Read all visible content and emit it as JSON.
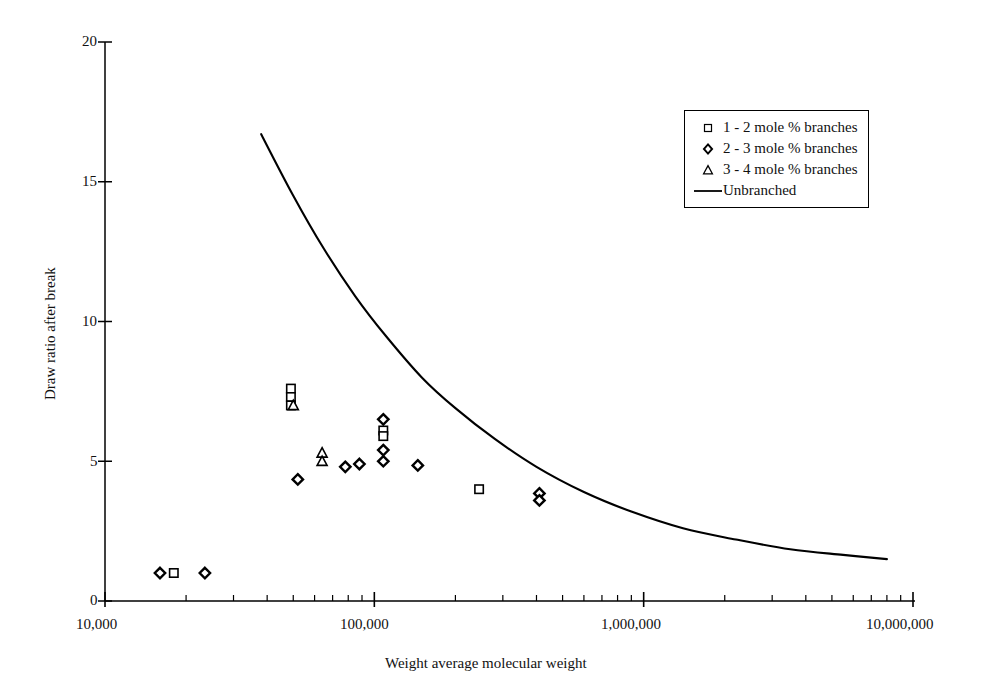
{
  "chart_data": {
    "type": "scatter",
    "title": "",
    "xlabel": "Weight average molecular weight",
    "ylabel": "Draw ratio after break",
    "xscale": "log",
    "yscale": "linear",
    "xlim": [
      10000,
      10000000
    ],
    "ylim": [
      0,
      20
    ],
    "xticks": [
      "10,000",
      "100,000",
      "1,000,000",
      "10,000,000"
    ],
    "xtick_values": [
      10000,
      100000,
      1000000,
      10000000
    ],
    "yticks": [
      "0",
      "5",
      "10",
      "15",
      "20"
    ],
    "ytick_values": [
      0,
      5,
      10,
      15,
      20
    ],
    "grid": false,
    "legend_position": "top-right",
    "series": [
      {
        "name": "1 - 2 mole % branches",
        "marker": "open-square",
        "points": [
          {
            "x": 18000,
            "y": 1.0
          },
          {
            "x": 49000,
            "y": 7.6
          },
          {
            "x": 49000,
            "y": 7.3
          },
          {
            "x": 49000,
            "y": 7.0
          },
          {
            "x": 108000,
            "y": 6.1
          },
          {
            "x": 108000,
            "y": 5.9
          },
          {
            "x": 245000,
            "y": 4.0
          }
        ]
      },
      {
        "name": "2 - 3 mole % branches",
        "marker": "open-diamond",
        "points": [
          {
            "x": 16000,
            "y": 1.0
          },
          {
            "x": 23500,
            "y": 1.0
          },
          {
            "x": 52000,
            "y": 4.35
          },
          {
            "x": 78000,
            "y": 4.8
          },
          {
            "x": 88000,
            "y": 4.9
          },
          {
            "x": 108000,
            "y": 6.5
          },
          {
            "x": 108000,
            "y": 5.4
          },
          {
            "x": 108000,
            "y": 5.0
          },
          {
            "x": 145000,
            "y": 4.85
          },
          {
            "x": 410000,
            "y": 3.85
          },
          {
            "x": 410000,
            "y": 3.6
          }
        ]
      },
      {
        "name": "3 - 4 mole % branches",
        "marker": "open-triangle",
        "points": [
          {
            "x": 50000,
            "y": 7.0
          },
          {
            "x": 64000,
            "y": 5.3
          },
          {
            "x": 64000,
            "y": 5.0
          }
        ]
      },
      {
        "name": "Unbranched",
        "marker": "line",
        "curve": [
          {
            "x": 38000,
            "y": 16.7
          },
          {
            "x": 50000,
            "y": 14.5
          },
          {
            "x": 65000,
            "y": 12.6
          },
          {
            "x": 85000,
            "y": 10.9
          },
          {
            "x": 110000,
            "y": 9.5
          },
          {
            "x": 150000,
            "y": 8.0
          },
          {
            "x": 200000,
            "y": 6.9
          },
          {
            "x": 280000,
            "y": 5.8
          },
          {
            "x": 400000,
            "y": 4.8
          },
          {
            "x": 600000,
            "y": 3.9
          },
          {
            "x": 900000,
            "y": 3.2
          },
          {
            "x": 1400000,
            "y": 2.6
          },
          {
            "x": 2200000,
            "y": 2.2
          },
          {
            "x": 3500000,
            "y": 1.85
          },
          {
            "x": 5500000,
            "y": 1.65
          },
          {
            "x": 8000000,
            "y": 1.5
          }
        ]
      }
    ]
  },
  "legend": {
    "items": [
      {
        "label": "1 - 2 mole % branches",
        "key": "open-square"
      },
      {
        "label": "2 - 3 mole % branches",
        "key": "open-diamond"
      },
      {
        "label": "3 - 4 mole % branches",
        "key": "open-triangle"
      },
      {
        "label": "Unbranched",
        "key": "line"
      }
    ]
  },
  "axes": {
    "y_title": "Draw ratio after break",
    "x_title": "Weight average molecular weight",
    "y_labels": [
      "20",
      "15",
      "10",
      "5",
      "0"
    ],
    "x_labels": [
      "10,000",
      "100,000",
      "1,000,000",
      "10,000,000"
    ]
  },
  "colors": {
    "axis": "#000000",
    "marker": "#000000",
    "curve": "#000000",
    "background": "#ffffff"
  }
}
